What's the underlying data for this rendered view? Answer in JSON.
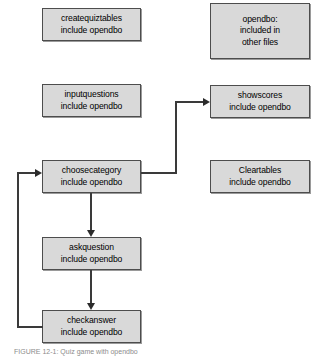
{
  "diagram": {
    "caption": "FIGURE 12-1: Quiz game with opendbo",
    "box_fill": "#d9d9d9",
    "box_border": "#4d4d4d",
    "connector_color": "#3a3a3a",
    "nodes": [
      {
        "id": "createquiztables",
        "lines": [
          "createquiztables",
          "include opendbo"
        ]
      },
      {
        "id": "opendbo",
        "lines": [
          "opendbo:",
          "included in",
          "other files"
        ]
      },
      {
        "id": "inputquestions",
        "lines": [
          "inputquestions",
          "include opendbo"
        ]
      },
      {
        "id": "showscores",
        "lines": [
          "showscores",
          "include opendbo"
        ]
      },
      {
        "id": "choosecategory",
        "lines": [
          "choosecategory",
          "include opendbo"
        ]
      },
      {
        "id": "cleartables",
        "lines": [
          "Cleartables",
          "include opendbo"
        ]
      },
      {
        "id": "askquestion",
        "lines": [
          "askquestion",
          "include opendbo"
        ]
      },
      {
        "id": "checkanswer",
        "lines": [
          "checkanswer",
          "include opendbo"
        ]
      }
    ],
    "edges": [
      {
        "id": "choosecategory-to-showscores",
        "from": "choosecategory",
        "to": "showscores"
      },
      {
        "id": "choosecategory-to-askquestion",
        "from": "choosecategory",
        "to": "askquestion"
      },
      {
        "id": "askquestion-to-checkanswer",
        "from": "askquestion",
        "to": "checkanswer"
      },
      {
        "id": "checkanswer-to-choosecategory",
        "from": "checkanswer",
        "to": "choosecategory"
      }
    ]
  }
}
